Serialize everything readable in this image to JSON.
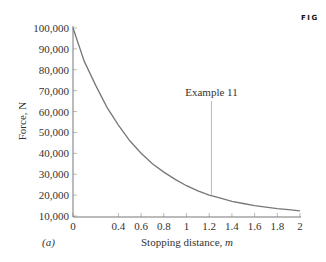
{
  "figure": {
    "tag": "FIG",
    "panel_label": "(a)",
    "annotation": "Example 11"
  },
  "chart_data": {
    "type": "line",
    "title": "",
    "xlabel": "Stopping distance, m",
    "ylabel": "Force, N",
    "xlim": [
      0,
      2
    ],
    "ylim": [
      10000,
      100000
    ],
    "x_ticks": [
      "0",
      "0.4",
      "0.6",
      "0.8",
      "1",
      "1.2",
      "1.4",
      "1.6",
      "1.8",
      "2"
    ],
    "x_tick_values": [
      0,
      0.4,
      0.6,
      0.8,
      1,
      1.2,
      1.4,
      1.6,
      1.8,
      2
    ],
    "y_ticks": [
      "10,000",
      "20,000",
      "30,000",
      "40,000",
      "50,000",
      "60,000",
      "70,000",
      "80,000",
      "90,000",
      "100,000"
    ],
    "y_tick_values": [
      10000,
      20000,
      30000,
      40000,
      50000,
      60000,
      70000,
      80000,
      90000,
      100000
    ],
    "grid": false,
    "legend": null,
    "series": [
      {
        "name": "Force vs stopping distance",
        "x": [
          0,
          0.1,
          0.2,
          0.3,
          0.4,
          0.5,
          0.6,
          0.7,
          0.8,
          0.9,
          1.0,
          1.1,
          1.2,
          1.3,
          1.4,
          1.5,
          1.6,
          1.7,
          1.8,
          1.9,
          2.0
        ],
        "y": [
          100000,
          84000,
          72500,
          62000,
          53500,
          46000,
          40000,
          35000,
          31000,
          27500,
          24500,
          22000,
          20000,
          18500,
          17000,
          16000,
          15000,
          14200,
          13500,
          13000,
          12500
        ]
      }
    ],
    "annotations": [
      {
        "text": "Example 11",
        "x": 1.22,
        "y": 20000,
        "type": "vertical-line"
      }
    ]
  }
}
